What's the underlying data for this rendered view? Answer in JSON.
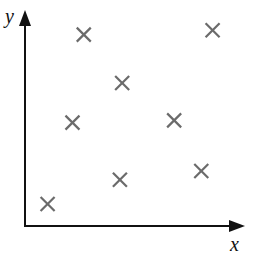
{
  "chart_data": {
    "type": "scatter",
    "title": "",
    "xlabel": "x",
    "ylabel": "y",
    "grid": false,
    "legend": null,
    "marker": "x",
    "marker_color": "#6b6b6b",
    "axis_color": "#111111",
    "xlim": [
      0,
      10
    ],
    "ylim": [
      0,
      10
    ],
    "points": [
      {
        "x": 2.6,
        "y": 8.7
      },
      {
        "x": 8.3,
        "y": 8.9
      },
      {
        "x": 4.3,
        "y": 6.5
      },
      {
        "x": 2.1,
        "y": 4.7
      },
      {
        "x": 6.6,
        "y": 4.8
      },
      {
        "x": 4.2,
        "y": 2.1
      },
      {
        "x": 7.8,
        "y": 2.5
      },
      {
        "x": 1.0,
        "y": 1.0
      }
    ]
  }
}
